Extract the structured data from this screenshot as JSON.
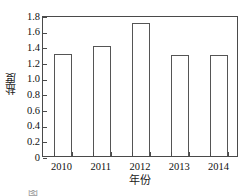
{
  "chart_data": {
    "type": "bar",
    "title": "",
    "xlabel": "年份",
    "ylabel": "盐度",
    "categories": [
      "2010",
      "2011",
      "2012",
      "2013",
      "2014"
    ],
    "values": [
      1.3,
      1.4,
      1.7,
      1.29,
      1.29
    ],
    "ylim": [
      0,
      1.8
    ],
    "ytick_labels": [
      "0",
      "0.2",
      "0.4",
      "0.6",
      "0.8",
      "1.0",
      "1.2",
      "1.4",
      "1.6",
      "1.8"
    ],
    "ytick_values": [
      0,
      0.2,
      0.4,
      0.6,
      0.8,
      1.0,
      1.2,
      1.4,
      1.6,
      1.8
    ],
    "grid": false,
    "legend": null,
    "bar_fill_color": "#ffffff",
    "bar_edge_color": "#555555",
    "axis_color": "#4a4a4a"
  },
  "caption": {
    "fragment": "图"
  }
}
